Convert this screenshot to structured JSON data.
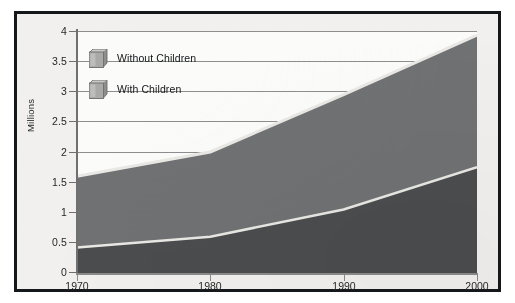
{
  "chart_data": {
    "type": "area",
    "stacked": true,
    "title": "",
    "subtitle": "",
    "xlabel": "",
    "ylabel": "Millions",
    "x": [
      1970,
      1980,
      1990,
      2000
    ],
    "xlim": [
      1970,
      2000
    ],
    "ylim": [
      0,
      4
    ],
    "ytick_labels": [
      "0",
      "0.5",
      "1",
      "1.5",
      "2",
      "2.5",
      "3",
      "3.5",
      "4"
    ],
    "ytick_values": [
      0,
      0.5,
      1,
      1.5,
      2,
      2.5,
      3,
      3.5,
      4
    ],
    "xtick_labels": [
      "1970",
      "1980",
      "1990",
      "2000"
    ],
    "grid": "horizontal",
    "legend_position": "inside-top-left",
    "series": [
      {
        "name": "With Children",
        "color": "#4a4c4e",
        "values": [
          0.42,
          0.6,
          1.05,
          1.75
        ]
      },
      {
        "name": "Without Children",
        "color": "#6f7173",
        "values": [
          1.18,
          1.4,
          1.9,
          2.18
        ]
      }
    ],
    "stacked_totals": [
      1.6,
      2.0,
      2.95,
      3.93
    ]
  },
  "legend": {
    "items": [
      {
        "label": "Without Children",
        "icon": "cube-swatch-icon"
      },
      {
        "label": "With Children",
        "icon": "cube-swatch-icon"
      }
    ]
  },
  "axes": {
    "y_title": "Millions"
  },
  "colors": {
    "frame_border": "#15181a",
    "panel_background": "#f1f0ee",
    "plot_background": "#fbfbfa",
    "gridline": "#8e8e8e",
    "axis_line": "#7a7a7a",
    "with_children": "#4a4c4e",
    "without_children": "#6f7173",
    "highlight_edge": "#e9e8e4",
    "text": "#26282a"
  }
}
